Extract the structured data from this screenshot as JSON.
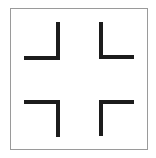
{
  "figure": {
    "frame_color": "#9a9a9a",
    "stroke_color": "#1c1c1c",
    "brackets": [
      {
        "name": "top-left",
        "orientation": "corner at bottom-right"
      },
      {
        "name": "top-right",
        "orientation": "corner at bottom-left"
      },
      {
        "name": "bottom-left",
        "orientation": "corner at top-right"
      },
      {
        "name": "bottom-right",
        "orientation": "corner at top-left"
      }
    ]
  }
}
